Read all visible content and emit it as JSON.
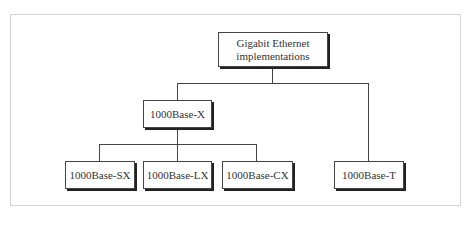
{
  "diagram": {
    "type": "hierarchy",
    "root": {
      "label_line1": "Gigabit Ethernet",
      "label_line2": "implementations"
    },
    "level1": [
      {
        "label": "1000Base-X"
      }
    ],
    "level2": [
      {
        "label": "1000Base-SX",
        "parent": "1000Base-X"
      },
      {
        "label": "1000Base-LX",
        "parent": "1000Base-X"
      },
      {
        "label": "1000Base-CX",
        "parent": "1000Base-X"
      },
      {
        "label": "1000Base-T",
        "parent": "Gigabit Ethernet implementations"
      }
    ]
  }
}
